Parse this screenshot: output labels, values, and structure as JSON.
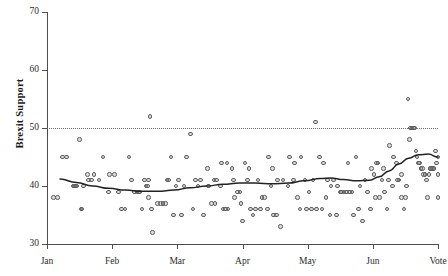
{
  "chart_data": {
    "type": "scatter",
    "title": "",
    "xlabel": "",
    "ylabel": "Brexit Support",
    "ylim": [
      30,
      70
    ],
    "yticks": [
      30,
      40,
      50,
      60,
      70
    ],
    "xticks": [
      "Jan",
      "Feb",
      "Mar",
      "Apr",
      "May",
      "Jun",
      "Vote"
    ],
    "xlim": [
      0,
      6
    ],
    "grid": false,
    "legend": null,
    "reference_line": {
      "y": 50,
      "style": "dotted",
      "color": "#6e6e6e"
    },
    "marker": {
      "shape": "circle",
      "filled": false,
      "color": "#5d5d5d",
      "size": 4.6
    },
    "series": [
      {
        "name": "Poll results",
        "points": [
          [
            0.1,
            38
          ],
          [
            0.3,
            45
          ],
          [
            0.42,
            40
          ],
          [
            0.44,
            40
          ],
          [
            0.46,
            40
          ],
          [
            0.5,
            48
          ],
          [
            0.52,
            36
          ],
          [
            0.54,
            36
          ],
          [
            0.62,
            42
          ],
          [
            0.64,
            41
          ],
          [
            0.72,
            42
          ],
          [
            0.86,
            45
          ],
          [
            0.94,
            39
          ],
          [
            1.04,
            42
          ],
          [
            1.14,
            36
          ],
          [
            1.2,
            36
          ],
          [
            1.3,
            41
          ],
          [
            1.34,
            39
          ],
          [
            1.38,
            39
          ],
          [
            1.4,
            39
          ],
          [
            1.46,
            36
          ],
          [
            1.5,
            41
          ],
          [
            1.52,
            40
          ],
          [
            1.54,
            40
          ],
          [
            1.56,
            38
          ],
          [
            1.58,
            52
          ],
          [
            1.6,
            36
          ],
          [
            1.62,
            32
          ],
          [
            1.74,
            37
          ],
          [
            1.78,
            37
          ],
          [
            1.82,
            37
          ],
          [
            1.86,
            41
          ],
          [
            1.9,
            45
          ],
          [
            1.94,
            35
          ],
          [
            2.02,
            41
          ],
          [
            2.06,
            35
          ],
          [
            2.14,
            45
          ],
          [
            2.2,
            49
          ],
          [
            2.28,
            41
          ],
          [
            2.32,
            40
          ],
          [
            2.4,
            35
          ],
          [
            2.46,
            43
          ],
          [
            2.52,
            37
          ],
          [
            2.56,
            41
          ],
          [
            2.6,
            41
          ],
          [
            2.66,
            40
          ],
          [
            2.7,
            36
          ],
          [
            2.74,
            36
          ],
          [
            2.78,
            36
          ],
          [
            2.84,
            43
          ],
          [
            2.88,
            38
          ],
          [
            2.92,
            39
          ],
          [
            2.96,
            39
          ],
          [
            3.0,
            34
          ],
          [
            3.04,
            44
          ],
          [
            3.1,
            43
          ],
          [
            3.12,
            36
          ],
          [
            3.16,
            35
          ],
          [
            3.24,
            41
          ],
          [
            3.3,
            38
          ],
          [
            3.34,
            38
          ],
          [
            3.4,
            45
          ],
          [
            3.44,
            40
          ],
          [
            3.48,
            35
          ],
          [
            3.52,
            35
          ],
          [
            3.58,
            33
          ],
          [
            3.72,
            45
          ],
          [
            3.78,
            41
          ],
          [
            3.84,
            38
          ],
          [
            3.9,
            45
          ],
          [
            3.96,
            41
          ],
          [
            4.02,
            39
          ],
          [
            4.06,
            36
          ],
          [
            4.12,
            51
          ],
          [
            4.18,
            45
          ],
          [
            4.24,
            44
          ],
          [
            4.28,
            38
          ],
          [
            4.34,
            35
          ],
          [
            4.4,
            41
          ],
          [
            4.46,
            40
          ],
          [
            4.5,
            39
          ],
          [
            4.52,
            39
          ],
          [
            4.56,
            39
          ],
          [
            4.6,
            39
          ],
          [
            4.64,
            39
          ],
          [
            4.68,
            39
          ],
          [
            4.74,
            45
          ],
          [
            4.8,
            40
          ],
          [
            4.84,
            34
          ],
          [
            4.92,
            39
          ],
          [
            4.98,
            43
          ],
          [
            5.02,
            42
          ],
          [
            5.06,
            44
          ],
          [
            5.08,
            44
          ],
          [
            5.14,
            41
          ],
          [
            5.18,
            39
          ],
          [
            5.22,
            36
          ],
          [
            5.26,
            47
          ],
          [
            5.32,
            45
          ],
          [
            5.36,
            44
          ],
          [
            5.4,
            41
          ],
          [
            5.44,
            38
          ],
          [
            5.48,
            36
          ],
          [
            5.54,
            55
          ],
          [
            5.58,
            50
          ],
          [
            5.6,
            50
          ],
          [
            5.62,
            50
          ],
          [
            5.64,
            50
          ],
          [
            5.66,
            46
          ],
          [
            5.68,
            45
          ],
          [
            5.7,
            44
          ],
          [
            5.72,
            44
          ],
          [
            5.74,
            43
          ],
          [
            5.76,
            43
          ],
          [
            5.78,
            42
          ],
          [
            5.8,
            42
          ],
          [
            5.82,
            41
          ],
          [
            5.84,
            38
          ],
          [
            5.86,
            42
          ],
          [
            5.88,
            43
          ],
          [
            5.9,
            43
          ],
          [
            5.92,
            43
          ],
          [
            5.94,
            43
          ],
          [
            5.96,
            46
          ],
          [
            5.98,
            44
          ],
          [
            6.0,
            45
          ],
          [
            6.0,
            42
          ],
          [
            6.0,
            38
          ],
          [
            5.56,
            48
          ],
          [
            5.52,
            40
          ],
          [
            5.5,
            38
          ],
          [
            5.44,
            42
          ],
          [
            5.38,
            41
          ],
          [
            5.3,
            40
          ],
          [
            5.24,
            41
          ],
          [
            5.16,
            43
          ],
          [
            5.1,
            38
          ],
          [
            5.04,
            38
          ],
          [
            4.96,
            36
          ],
          [
            4.88,
            41
          ],
          [
            4.78,
            36
          ],
          [
            4.7,
            35
          ],
          [
            4.62,
            44
          ],
          [
            4.44,
            35
          ],
          [
            4.36,
            40
          ],
          [
            4.3,
            41
          ],
          [
            4.22,
            36
          ],
          [
            4.14,
            36
          ],
          [
            4.08,
            41
          ],
          [
            3.98,
            36
          ],
          [
            3.88,
            36
          ],
          [
            3.8,
            44
          ],
          [
            3.7,
            40
          ],
          [
            3.62,
            41
          ],
          [
            3.54,
            41
          ],
          [
            3.46,
            43
          ],
          [
            3.38,
            36
          ],
          [
            3.28,
            36
          ],
          [
            3.2,
            36
          ],
          [
            3.08,
            41
          ],
          [
            2.98,
            37
          ],
          [
            2.86,
            41
          ],
          [
            2.76,
            44
          ],
          [
            2.68,
            44
          ],
          [
            2.58,
            37
          ],
          [
            2.48,
            40
          ],
          [
            2.36,
            41
          ],
          [
            2.24,
            36
          ],
          [
            2.1,
            40
          ],
          [
            1.98,
            40
          ],
          [
            1.84,
            41
          ],
          [
            1.7,
            37
          ],
          [
            1.56,
            41
          ],
          [
            1.42,
            39
          ],
          [
            1.26,
            45
          ],
          [
            1.1,
            39
          ],
          [
            0.96,
            42
          ],
          [
            0.8,
            41
          ],
          [
            0.68,
            41
          ],
          [
            0.56,
            40
          ],
          [
            0.4,
            40
          ],
          [
            0.24,
            45
          ],
          [
            0.16,
            38
          ]
        ]
      }
    ],
    "trend": {
      "name": "LOESS smoother",
      "color": "#222222",
      "points": [
        [
          0.2,
          41.2
        ],
        [
          0.45,
          40.6
        ],
        [
          0.7,
          40.0
        ],
        [
          0.95,
          39.6
        ],
        [
          1.2,
          39.3
        ],
        [
          1.45,
          39.1
        ],
        [
          1.7,
          39.1
        ],
        [
          1.95,
          39.3
        ],
        [
          2.2,
          39.7
        ],
        [
          2.45,
          40.0
        ],
        [
          2.7,
          40.3
        ],
        [
          2.95,
          40.5
        ],
        [
          3.2,
          40.5
        ],
        [
          3.45,
          40.4
        ],
        [
          3.7,
          40.5
        ],
        [
          3.95,
          40.9
        ],
        [
          4.2,
          41.3
        ],
        [
          4.35,
          41.4
        ],
        [
          4.55,
          41.1
        ],
        [
          4.75,
          40.9
        ],
        [
          4.95,
          41.0
        ],
        [
          5.1,
          41.6
        ],
        [
          5.25,
          42.6
        ],
        [
          5.4,
          43.8
        ],
        [
          5.55,
          44.8
        ],
        [
          5.7,
          45.4
        ],
        [
          5.85,
          45.5
        ],
        [
          6.0,
          45.0
        ]
      ]
    }
  }
}
